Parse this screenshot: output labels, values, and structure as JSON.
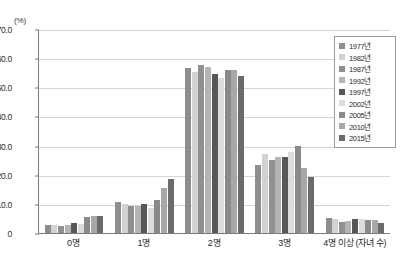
{
  "chart_data": {
    "type": "bar",
    "title": "",
    "subtitle": "",
    "xlabel": "자녀 수",
    "ylabel": "(%)",
    "unit_label": "(%)",
    "axis_title_suffix": "(자녀 수)",
    "categories": [
      "0명",
      "1명",
      "2명",
      "3명",
      "4명 이상"
    ],
    "ylim": [
      0,
      70
    ],
    "yticks": [
      "0",
      "10.0",
      "20.0",
      "30.0",
      "40.0",
      "50.0",
      "60.0",
      "70.0"
    ],
    "ytick_values": [
      0,
      10,
      20,
      30,
      40,
      50,
      60,
      70
    ],
    "grid": true,
    "legend_position": "top-right",
    "series": [
      {
        "name": "1977년",
        "color": "#8e8e8e",
        "values": [
          2.8,
          10.6,
          56.5,
          23.5,
          5.2
        ]
      },
      {
        "name": "1982년",
        "color": "#d2d2d2",
        "values": [
          2.7,
          9.9,
          55.3,
          27.1,
          4.9
        ]
      },
      {
        "name": "1987년",
        "color": "#909090",
        "values": [
          2.5,
          9.4,
          57.5,
          24.9,
          3.9
        ]
      },
      {
        "name": "1992년",
        "color": "#b4b4b4",
        "values": [
          2.7,
          9.3,
          56.8,
          26.1,
          4.1
        ]
      },
      {
        "name": "1997년",
        "color": "#575757",
        "values": [
          3.6,
          9.8,
          54.5,
          26.0,
          4.7
        ]
      },
      {
        "name": "2002년",
        "color": "#dcdcdc",
        "values": [
          3.2,
          8.6,
          53.3,
          27.9,
          4.9
        ]
      },
      {
        "name": "2005년",
        "color": "#8a8a8a",
        "values": [
          5.4,
          11.4,
          55.8,
          29.7,
          4.3
        ]
      },
      {
        "name": "2010년",
        "color": "#a8a8a8",
        "values": [
          6.0,
          15.5,
          56.1,
          22.2,
          4.3
        ]
      },
      {
        "name": "2015년",
        "color": "#6b6b6b",
        "values": [
          5.9,
          18.4,
          53.8,
          19.3,
          3.4
        ]
      }
    ],
    "legend_entries": [
      "1977년",
      "1982년",
      "1987년",
      "1992년",
      "1997년",
      "2002년",
      "2005년",
      "2010년",
      "2015년"
    ]
  }
}
